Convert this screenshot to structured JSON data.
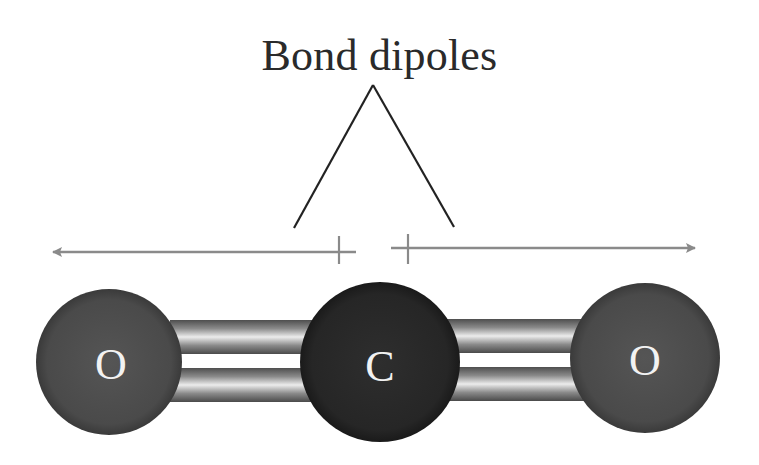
{
  "title": "Bond dipoles",
  "atoms": [
    {
      "symbol": "O",
      "cx": 109,
      "cy": 362,
      "r": 73,
      "color": "#4a4a4a"
    },
    {
      "symbol": "C",
      "cx": 380,
      "cy": 362,
      "r": 80,
      "color": "#262626"
    },
    {
      "symbol": "O",
      "cx": 645,
      "cy": 358,
      "r": 75,
      "color": "#4a4a4a"
    }
  ],
  "dipole_arrows": [
    {
      "name": "left",
      "from_x": 343,
      "to_x": 53,
      "y": 252,
      "cross_x": 339
    },
    {
      "name": "right",
      "from_x": 395,
      "to_x": 695,
      "y": 248,
      "cross_x": 408
    }
  ],
  "pointer_lines": {
    "apex": [
      373,
      85
    ],
    "left_end": [
      294,
      228
    ],
    "right_end": [
      454,
      227
    ]
  },
  "colors": {
    "arrow": "#8a8a8a",
    "pointer": "#222222",
    "bond_dark": "#5a5a5a",
    "bond_light": "#e8e8e8"
  }
}
